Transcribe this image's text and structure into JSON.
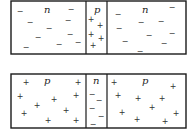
{
  "diagrams": [
    {
      "name": "npn-junction",
      "regions": [
        {
          "label": "n",
          "carrier_symbol": "−",
          "carrier_type": "electron",
          "carrier_count": 10
        },
        {
          "label": "p",
          "carrier_symbol": "+",
          "carrier_type": "hole",
          "carrier_count": 5
        },
        {
          "label": "n",
          "carrier_symbol": "−",
          "carrier_type": "electron",
          "carrier_count": 10
        }
      ]
    },
    {
      "name": "pnp-junction",
      "regions": [
        {
          "label": "p",
          "carrier_symbol": "+",
          "carrier_type": "hole",
          "carrier_count": 10
        },
        {
          "label": "n",
          "carrier_symbol": "−",
          "carrier_type": "electron",
          "carrier_count": 5
        },
        {
          "label": "p",
          "carrier_symbol": "+",
          "carrier_type": "hole",
          "carrier_count": 10
        }
      ]
    }
  ]
}
